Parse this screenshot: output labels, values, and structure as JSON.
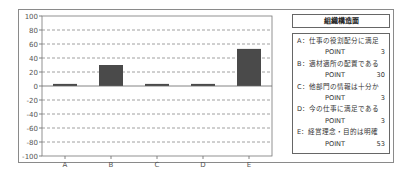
{
  "chart_data": {
    "type": "bar",
    "title": "",
    "xlabel": "",
    "ylabel": "",
    "categories": [
      "A",
      "B",
      "C",
      "D",
      "E"
    ],
    "values": [
      3,
      30,
      3,
      3,
      53
    ],
    "ylim": [
      -100,
      100
    ],
    "yticks": [
      100,
      80,
      60,
      40,
      20,
      0,
      -20,
      -40,
      -60,
      -80,
      -100
    ],
    "grid": true,
    "bar_color": "#4a4a4a",
    "legend_placement": "right"
  },
  "legend": {
    "title": "組織構造面",
    "point_label": "POINT",
    "items": [
      {
        "label": "A：仕事の役割配分に満足",
        "value": "3"
      },
      {
        "label": "B：適材適所の配置である",
        "value": "30"
      },
      {
        "label": "C：他部門の情報は十分か",
        "value": "3"
      },
      {
        "label": "D：今の仕事に満足である",
        "value": "3"
      },
      {
        "label": "E：経営理念・目的は明確",
        "value": "53"
      }
    ]
  }
}
